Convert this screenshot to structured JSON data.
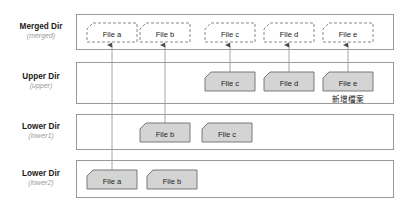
{
  "diagram": {
    "colors": {
      "panel_border": "#9a9a9a",
      "solid_file_fill": "#d4d4d4",
      "solid_file_stroke": "#6e6e6e",
      "dashed_file_stroke": "#7a7a7a",
      "connector": "#8d8d8d",
      "label_title": "#1a1a1a",
      "label_sub": "#9b9b9b"
    },
    "rows": [
      {
        "id": "merged",
        "title": "Merged Dir",
        "sub": "(merged)",
        "style": "dashed",
        "files": [
          {
            "label": "File a"
          },
          {
            "label": "File b"
          },
          {
            "label": "File c"
          },
          {
            "label": "File d"
          },
          {
            "label": "File e"
          }
        ]
      },
      {
        "id": "upper",
        "title": "Upper Dir",
        "sub": "(upper)",
        "style": "solid",
        "files": [
          {
            "label": "File c"
          },
          {
            "label": "File d"
          },
          {
            "label": "File e",
            "note": "新增檔案"
          }
        ]
      },
      {
        "id": "lower1",
        "title": "Lower Dir",
        "sub": "(lower1)",
        "style": "solid",
        "files": [
          {
            "label": "File b"
          },
          {
            "label": "File c"
          }
        ]
      },
      {
        "id": "lower2",
        "title": "Lower Dir",
        "sub": "(lower2)",
        "style": "solid",
        "files": [
          {
            "label": "File a"
          },
          {
            "label": "File b"
          }
        ]
      }
    ]
  }
}
